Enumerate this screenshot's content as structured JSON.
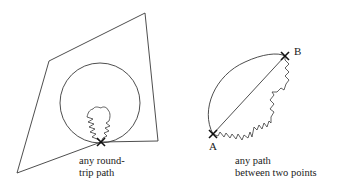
{
  "figure": {
    "left_panel": {
      "caption_lines": [
        "any round-",
        "trip path"
      ]
    },
    "right_panel": {
      "point_a_label": "A",
      "point_b_label": "B",
      "caption_lines": [
        "any path",
        "between two points"
      ]
    }
  }
}
